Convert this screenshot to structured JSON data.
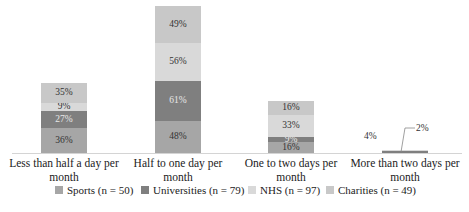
{
  "chart_data": {
    "type": "bar",
    "stacked": true,
    "title": "",
    "xlabel": "",
    "ylabel": "",
    "grid": false,
    "legend_position": "bottom",
    "categories": [
      "Less than half a day per month",
      "Half to one day per month",
      "One to two days per month",
      "More than two days per month"
    ],
    "series": [
      {
        "name": "Sports (n = 50)",
        "color": "#a6a6a6",
        "values": [
          36,
          48,
          16,
          0
        ]
      },
      {
        "name": "Universities (n = 79)",
        "color": "#7f7f7f",
        "values": [
          27,
          61,
          9,
          2
        ]
      },
      {
        "name": "NHS (n = 97)",
        "color": "#d9d9d9",
        "values": [
          9,
          56,
          33,
          4
        ]
      },
      {
        "name": "Charities (n = 49)",
        "color": "#c8c8c8",
        "values": [
          35,
          49,
          16,
          0
        ]
      }
    ],
    "data_labels": [
      [
        "36%",
        "27%",
        "9%",
        "35%"
      ],
      [
        "48%",
        "61%",
        "56%",
        "49%"
      ],
      [
        "16%",
        "9%",
        "33%",
        "16%"
      ],
      [
        "",
        "2%",
        "4%",
        ""
      ]
    ]
  },
  "categories": [
    {
      "label_line1": "Less than half a day per",
      "label_line2": "month"
    },
    {
      "label_line1": "Half to one day per",
      "label_line2": "month"
    },
    {
      "label_line1": "One to two days per",
      "label_line2": "month"
    },
    {
      "label_line1": "More than two days per",
      "label_line2": "month"
    }
  ],
  "bars": [
    {
      "segments": [
        {
          "label": "36%",
          "height": 25,
          "color": "#a6a6a6",
          "text": "#333"
        },
        {
          "label": "27%",
          "height": 17,
          "color": "#7f7f7f",
          "text": "#e8e8e8"
        },
        {
          "label": "9%",
          "height": 8,
          "color": "#d9d9d9",
          "text": "#333"
        },
        {
          "label": "35%",
          "height": 20,
          "color": "#c8c8c8",
          "text": "#333"
        }
      ]
    },
    {
      "segments": [
        {
          "label": "48%",
          "height": 32,
          "color": "#a6a6a6",
          "text": "#333"
        },
        {
          "label": "61%",
          "height": 40,
          "color": "#7f7f7f",
          "text": "#e8e8e8"
        },
        {
          "label": "56%",
          "height": 38,
          "color": "#d9d9d9",
          "text": "#333"
        },
        {
          "label": "49%",
          "height": 37,
          "color": "#c8c8c8",
          "text": "#333"
        }
      ]
    },
    {
      "segments": [
        {
          "label": "16%",
          "height": 11,
          "color": "#a6a6a6",
          "text": "#333"
        },
        {
          "label": "9%",
          "height": 5,
          "color": "#7f7f7f",
          "text": "#e8e8e8"
        },
        {
          "label": "33%",
          "height": 22,
          "color": "#d9d9d9",
          "text": "#333"
        },
        {
          "label": "16%",
          "height": 14,
          "color": "#c8c8c8",
          "text": "#333"
        }
      ]
    },
    {
      "segments": [
        {
          "label": "",
          "height": 0,
          "color": "#a6a6a6",
          "text": "#333"
        },
        {
          "label": "",
          "height": 2,
          "color": "#7f7f7f",
          "text": "#333"
        },
        {
          "label": "",
          "height": 1,
          "color": "#d9d9d9",
          "text": "#333"
        },
        {
          "label": "",
          "height": 0,
          "color": "#c8c8c8",
          "text": "#333"
        }
      ],
      "external_labels": {
        "left": "4%",
        "right": "2%"
      }
    }
  ],
  "legend": [
    {
      "label": "Sports (n = 50)",
      "color": "#a6a6a6"
    },
    {
      "label": "Universities (n = 79)",
      "color": "#7f7f7f"
    },
    {
      "label": "NHS (n = 97)",
      "color": "#d9d9d9"
    },
    {
      "label": "Charities (n = 49)",
      "color": "#c8c8c8"
    }
  ]
}
